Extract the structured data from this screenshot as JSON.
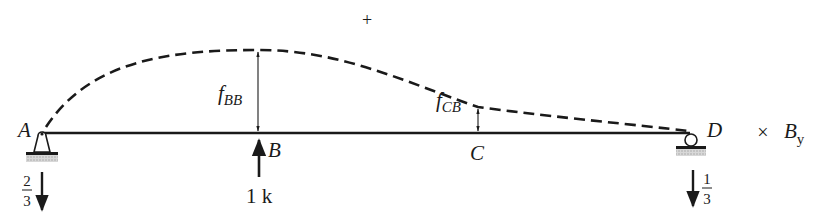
{
  "diagram": {
    "sign_label": "+",
    "points": {
      "A": {
        "label": "A",
        "support": "pin"
      },
      "B": {
        "label": "B"
      },
      "C": {
        "label": "C"
      },
      "D": {
        "label": "D",
        "support": "roller"
      }
    },
    "deflections": {
      "f_BB": {
        "base": "f",
        "sub": "BB"
      },
      "f_CB": {
        "base": "f",
        "sub": "CB"
      }
    },
    "load": {
      "label": "1 k",
      "direction": "up",
      "at": "B"
    },
    "reactions": {
      "A": {
        "num": "2",
        "den": "3",
        "direction": "down"
      },
      "D": {
        "num": "1",
        "den": "3",
        "direction": "down"
      }
    },
    "multiplier": {
      "symbol": "×",
      "base": "B",
      "sub": "y"
    },
    "colors": {
      "ink": "#1a1a1a",
      "hatch": "#b0b0b0"
    }
  }
}
